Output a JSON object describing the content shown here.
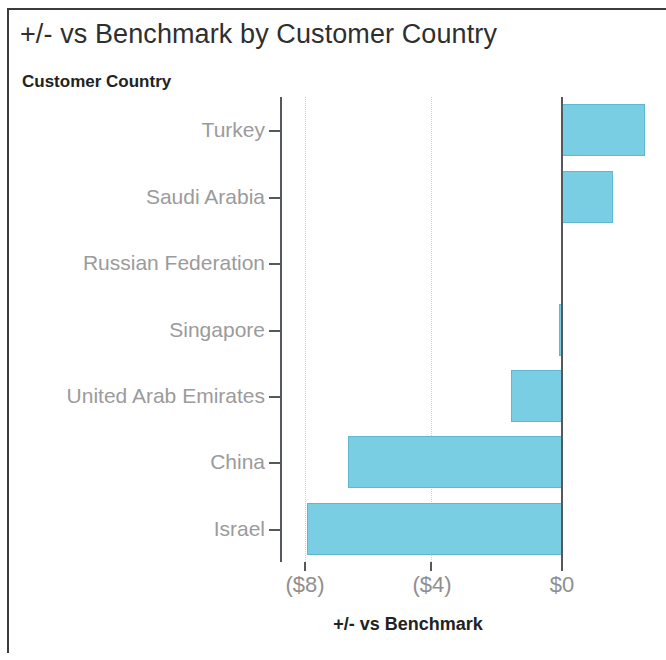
{
  "header": {
    "title": "+/- vs Benchmark by Customer Country"
  },
  "axes": {
    "y_field_caption": "Customer Country",
    "x_axis_title": "+/- vs Benchmark",
    "x_tick_labels": [
      "($8)",
      "($4)",
      "$0"
    ]
  },
  "colors": {
    "bar_fill": "#79cee3",
    "bar_stroke": "#5fb8cf",
    "axis_line": "#55585c",
    "tick_text": "#9b9b9b",
    "frame": "#3b3b3b"
  },
  "chart_data": {
    "type": "bar",
    "orientation": "horizontal",
    "title": "+/- vs Benchmark by Customer Country",
    "xlabel": "+/- vs Benchmark",
    "ylabel": "Customer Country",
    "xlim": [
      -8.3,
      2.9
    ],
    "xticks": [
      -8,
      -4,
      0
    ],
    "xtick_labels": [
      "($8)",
      "($4)",
      "$0"
    ],
    "grid": "vertical-dotted",
    "legend": "none",
    "categories": [
      "Turkey",
      "Saudi Arabia",
      "Russian Federation",
      "Singapore",
      "United Arab Emirates",
      "China",
      "Israel"
    ],
    "values": [
      2.6,
      1.6,
      0.0,
      -0.1,
      -1.6,
      -6.7,
      -8.0
    ]
  }
}
